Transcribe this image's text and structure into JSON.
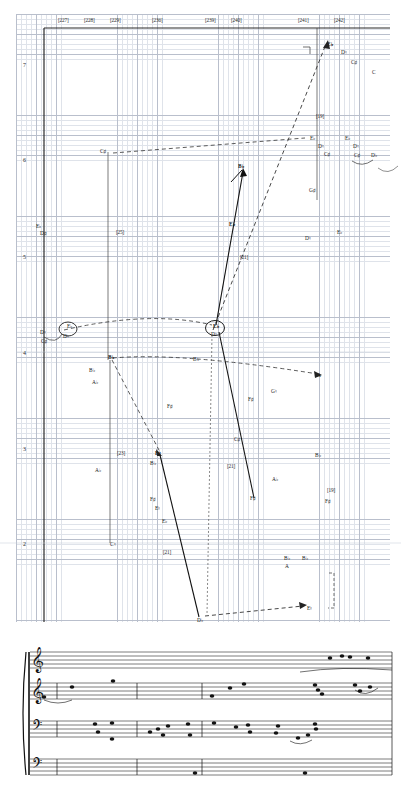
{
  "graph": {
    "name": "voice-leading-analysis-graph",
    "measure_labels": [
      {
        "text": "[227]",
        "x": 58,
        "y": 17
      },
      {
        "text": "[228]",
        "x": 84,
        "y": 17
      },
      {
        "text": "[229]",
        "x": 110,
        "y": 17
      },
      {
        "text": "[236]",
        "x": 152,
        "y": 17
      },
      {
        "text": "[239]",
        "x": 205,
        "y": 17
      },
      {
        "text": "[240]",
        "x": 231,
        "y": 17
      },
      {
        "text": "[241]",
        "x": 298,
        "y": 17
      },
      {
        "text": "[242]",
        "x": 334,
        "y": 17
      }
    ],
    "octave_labels": [
      {
        "text": "7",
        "x": 23,
        "y": 62
      },
      {
        "text": "6",
        "x": 23,
        "y": 157
      },
      {
        "text": "5",
        "x": 23,
        "y": 254
      },
      {
        "text": "4",
        "x": 23,
        "y": 350
      },
      {
        "text": "3",
        "x": 23,
        "y": 446
      },
      {
        "text": "2",
        "x": 23,
        "y": 541
      }
    ],
    "inner_measure_labels": [
      {
        "text": "[19]",
        "x": 316,
        "y": 113
      },
      {
        "text": "[25]",
        "x": 116,
        "y": 229
      },
      {
        "text": "[21]",
        "x": 240,
        "y": 254
      },
      {
        "text": "[23]",
        "x": 117,
        "y": 450
      },
      {
        "text": "[21]",
        "x": 227,
        "y": 463
      },
      {
        "text": "[19]",
        "x": 327,
        "y": 487
      },
      {
        "text": "[21]",
        "x": 163,
        "y": 549
      }
    ],
    "pitch_labels": [
      {
        "text": "E♭",
        "x": 327,
        "y": 42,
        "bold": true
      },
      {
        "text": "D♮",
        "x": 341,
        "y": 50,
        "bold": false
      },
      {
        "text": "C♯",
        "x": 351,
        "y": 60,
        "bold": false
      },
      {
        "text": "C",
        "x": 372,
        "y": 70,
        "bold": false
      },
      {
        "text": "E♭",
        "x": 310,
        "y": 136,
        "bold": false
      },
      {
        "text": "D♮",
        "x": 318,
        "y": 144,
        "bold": false
      },
      {
        "text": "C♯",
        "x": 324,
        "y": 152,
        "bold": false
      },
      {
        "text": "E♭",
        "x": 345,
        "y": 136,
        "bold": false
      },
      {
        "text": "D♮",
        "x": 353,
        "y": 144,
        "bold": false
      },
      {
        "text": "C♯",
        "x": 354,
        "y": 153,
        "bold": false
      },
      {
        "text": "D♭",
        "x": 371,
        "y": 153,
        "bold": false
      },
      {
        "text": "C♯",
        "x": 100,
        "y": 149,
        "bold": false
      },
      {
        "text": "B♭",
        "x": 238,
        "y": 164,
        "bold": true
      },
      {
        "text": "G♯",
        "x": 309,
        "y": 188,
        "bold": false
      },
      {
        "text": "E♭",
        "x": 36,
        "y": 224,
        "bold": false
      },
      {
        "text": "D♯",
        "x": 40,
        "y": 231,
        "bold": false
      },
      {
        "text": "E♭",
        "x": 229,
        "y": 222,
        "bold": true
      },
      {
        "text": "D♮",
        "x": 305,
        "y": 236,
        "bold": false
      },
      {
        "text": "E♭",
        "x": 337,
        "y": 230,
        "bold": false
      },
      {
        "text": "D♮",
        "x": 40,
        "y": 330,
        "bold": false
      },
      {
        "text": "C♯",
        "x": 41,
        "y": 339,
        "bold": false
      },
      {
        "text": "E♭",
        "x": 67,
        "y": 324,
        "bold": false
      },
      {
        "text": "D♮",
        "x": 63,
        "y": 334,
        "bold": false
      },
      {
        "text": "E♭",
        "x": 213,
        "y": 324,
        "bold": true
      },
      {
        "text": "D♮",
        "x": 211,
        "y": 332,
        "bold": false
      },
      {
        "text": "B♭",
        "x": 108,
        "y": 355,
        "bold": true
      },
      {
        "text": "B♭",
        "x": 193,
        "y": 357,
        "bold": false
      },
      {
        "text": "A",
        "x": 317,
        "y": 373,
        "bold": false
      },
      {
        "text": "B♭",
        "x": 89,
        "y": 368,
        "bold": false
      },
      {
        "text": "A♭",
        "x": 92,
        "y": 380,
        "bold": false
      },
      {
        "text": "G♮",
        "x": 271,
        "y": 389,
        "bold": false
      },
      {
        "text": "F♯",
        "x": 248,
        "y": 397,
        "bold": false
      },
      {
        "text": "F♯",
        "x": 167,
        "y": 404,
        "bold": false
      },
      {
        "text": "A♭",
        "x": 95,
        "y": 468,
        "bold": false
      },
      {
        "text": "B♮",
        "x": 155,
        "y": 451,
        "bold": true
      },
      {
        "text": "B♭",
        "x": 150,
        "y": 461,
        "bold": false
      },
      {
        "text": "C♯",
        "x": 234,
        "y": 437,
        "bold": false
      },
      {
        "text": "B♭",
        "x": 315,
        "y": 453,
        "bold": false
      },
      {
        "text": "A♭",
        "x": 272,
        "y": 477,
        "bold": false
      },
      {
        "text": "F♯",
        "x": 150,
        "y": 497,
        "bold": false
      },
      {
        "text": "E♮",
        "x": 155,
        "y": 506,
        "bold": false
      },
      {
        "text": "F♯",
        "x": 250,
        "y": 496,
        "bold": false
      },
      {
        "text": "F♯",
        "x": 325,
        "y": 499,
        "bold": false
      },
      {
        "text": "E♭",
        "x": 162,
        "y": 519,
        "bold": false
      },
      {
        "text": "C♮",
        "x": 110,
        "y": 542,
        "bold": false
      },
      {
        "text": "B♭",
        "x": 284,
        "y": 556,
        "bold": false
      },
      {
        "text": "A",
        "x": 285,
        "y": 564,
        "bold": false
      },
      {
        "text": "B♭",
        "x": 302,
        "y": 556,
        "bold": false
      },
      {
        "text": "D♭",
        "x": 197,
        "y": 618,
        "bold": false
      },
      {
        "text": "E♮",
        "x": 307,
        "y": 606,
        "bold": false
      }
    ]
  },
  "score": {
    "name": "score-excerpt",
    "instrument_labels": [
      {
        "text": "Picc.",
        "x": 319,
        "y": 635
      },
      {
        "text": "Fl., Hns.",
        "x": 57,
        "y": 677
      },
      {
        "text": "Tpt., Fl.",
        "x": 102,
        "y": 670
      },
      {
        "text": "Tpts.",
        "x": 204,
        "y": 681
      },
      {
        "text": "E♭ Cl.",
        "x": 296,
        "y": 677
      },
      {
        "text": "Tpts.",
        "x": 297,
        "y": 690
      },
      {
        "text": "Cb., Piano",
        "x": 79,
        "y": 712
      },
      {
        "text": "Tba.",
        "x": 107,
        "y": 712
      },
      {
        "text": "Low Brass, Piano,",
        "x": 140,
        "y": 710
      },
      {
        "text": "Timp.",
        "x": 140,
        "y": 716
      },
      {
        "text": "Tbns., Tbas.",
        "x": 206,
        "y": 712
      },
      {
        "text": "Hns.",
        "x": 310,
        "y": 714
      }
    ]
  },
  "colors": {
    "grid_minor": "#dfe3ea",
    "grid_major": "#b9bfcc",
    "ink": "#1a1a1a",
    "axis": "#333333"
  }
}
